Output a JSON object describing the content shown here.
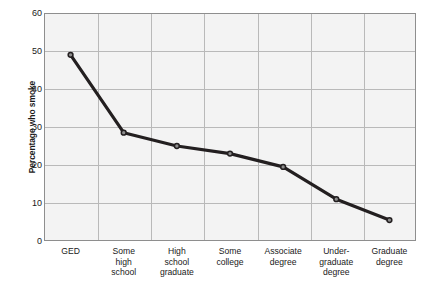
{
  "chart_data": {
    "type": "line",
    "title": "",
    "subtitle": "",
    "xlabel": "",
    "ylabel": "Percentage who smoke",
    "categories": [
      "GED",
      "Some high school",
      "High school graduate",
      "Some college",
      "Associate degree",
      "Under-graduate degree",
      "Graduate degree"
    ],
    "category_lines": [
      [
        "GED"
      ],
      [
        "Some",
        "high",
        "school"
      ],
      [
        "High",
        "school",
        "graduate"
      ],
      [
        "Some",
        "college"
      ],
      [
        "Associate",
        "degree"
      ],
      [
        "Under-",
        "graduate",
        "degree"
      ],
      [
        "Graduate",
        "degree"
      ]
    ],
    "values": [
      49,
      28.5,
      25,
      23,
      19.5,
      11,
      5.5
    ],
    "ylim": [
      0,
      60
    ],
    "ytick_values": [
      0,
      10,
      20,
      30,
      40,
      50,
      60
    ],
    "ytick_labels": [
      "0",
      "10",
      "20",
      "30",
      "40",
      "50",
      "60"
    ],
    "grid": true,
    "legend": "none",
    "series": [
      {
        "name": "Percentage who smoke",
        "values": [
          49,
          28.5,
          25,
          23,
          19.5,
          11,
          5.5
        ]
      }
    ],
    "colors": {
      "line": "#231f20",
      "marker_fill": "#8d8d8d",
      "marker_edge": "#231f20",
      "plot_background": "#f3f3f3",
      "gridline": "#b9b9b9",
      "frame": "#8e8e8e",
      "text": "#1a1a1a",
      "page_background": "#ffffff"
    }
  }
}
